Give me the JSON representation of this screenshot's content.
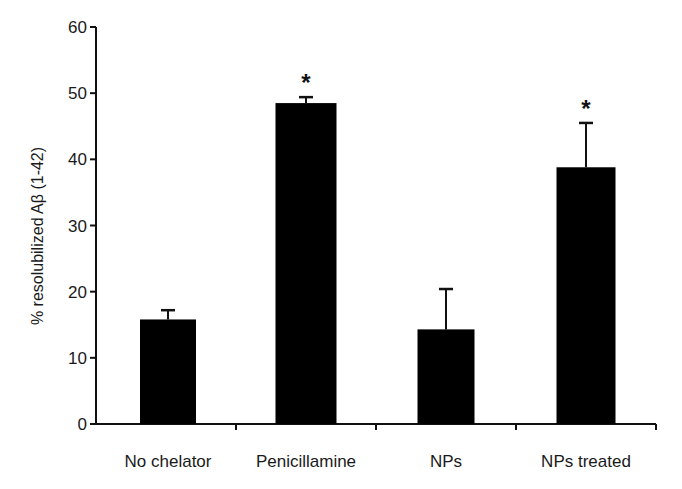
{
  "chart_data": {
    "type": "bar",
    "title": "",
    "xlabel": "",
    "ylabel": "% resolubilized Aβ (1-42)",
    "ylim": [
      0,
      60
    ],
    "yticks": [
      0,
      10,
      20,
      30,
      40,
      50,
      60
    ],
    "grid": false,
    "legend": null,
    "categories": [
      "No chelator",
      "Penicillamine",
      "NPs",
      "NPs treated"
    ],
    "values": [
      15.8,
      48.5,
      14.3,
      38.8
    ],
    "error_upper": [
      17.2,
      49.4,
      20.4,
      45.5
    ],
    "significance": [
      "",
      "*",
      "",
      "*"
    ],
    "bar_color": "#000000"
  }
}
